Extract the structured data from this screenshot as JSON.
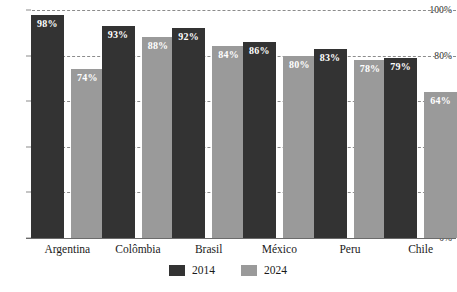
{
  "chart_data": {
    "type": "bar",
    "title": "",
    "subtitle": "",
    "xlabel": "",
    "ylabel": "",
    "categories": [
      "Argentina",
      "Colômbia",
      "Brasil",
      "México",
      "Peru",
      "Chile"
    ],
    "series": [
      {
        "name": "2014",
        "color": "#333333",
        "values": [
          98,
          93,
          92,
          86,
          83,
          79
        ],
        "value_labels": [
          "98%",
          "93%",
          "92%",
          "86%",
          "83%",
          "79%"
        ]
      },
      {
        "name": "2024",
        "color": "#9a9a9a",
        "values": [
          74,
          88,
          84,
          80,
          78,
          64
        ],
        "value_labels": [
          "74%",
          "88%",
          "84%",
          "80%",
          "78%",
          "64%"
        ]
      }
    ],
    "ylim": [
      0,
      100
    ],
    "yticks": [
      0,
      20,
      40,
      60,
      80,
      100
    ],
    "ytick_labels": [
      "0%",
      "20%",
      "40%",
      "60%",
      "80%",
      "100%"
    ],
    "grid": true,
    "grid_style": "dashed",
    "grid_color": "#8c8c8c",
    "legend_position": "bottom",
    "background_color": "#ffffff"
  },
  "legend": {
    "items": [
      {
        "label": "2014",
        "swatch": "swatch-2014"
      },
      {
        "label": "2024",
        "swatch": "swatch-2024"
      }
    ]
  }
}
